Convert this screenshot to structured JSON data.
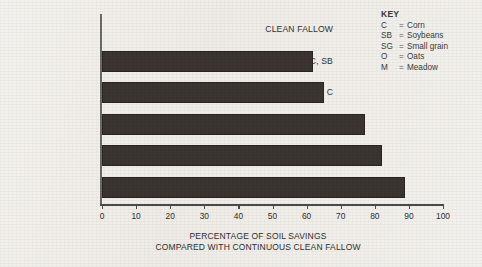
{
  "key": {
    "title": "KEY",
    "equals": "=",
    "entries": [
      {
        "symbol": "C",
        "definition": "Corn"
      },
      {
        "symbol": "SB",
        "definition": "Soybeans"
      },
      {
        "symbol": "SG",
        "definition": "Small grain"
      },
      {
        "symbol": "O",
        "definition": "Oats"
      },
      {
        "symbol": "M",
        "definition": "Meadow"
      }
    ]
  },
  "caption": {
    "line1": "PERCENTAGE OF SOIL SAVINGS",
    "line2": "COMPARED WITH CONTINUOUS CLEAN FALLOW"
  },
  "colors": {
    "bar": "#3b3430",
    "axis": "#4a4a4a",
    "background": "#f2f0ec",
    "text": "#2e2e2e"
  },
  "chart_data": {
    "type": "bar",
    "orientation": "horizontal",
    "title": "",
    "xlabel": "PERCENTAGE OF SOIL SAVINGS COMPARED WITH CONTINUOUS CLEAN FALLOW",
    "ylabel": "",
    "xlim": [
      0,
      100
    ],
    "xticks": [
      0,
      10,
      20,
      30,
      40,
      50,
      60,
      70,
      80,
      90,
      100
    ],
    "xtick_labels": [
      "0",
      "10",
      "20",
      "30",
      "40",
      "50",
      "60",
      "70",
      "80",
      "90",
      "100"
    ],
    "grid": false,
    "legend": "none",
    "categories": [
      "CLEAN FALLOW",
      "C, SB",
      "C, C",
      "C, SG, SB, SG",
      "C, SB, C, O, M, M",
      "C, C, O, M, M, M"
    ],
    "values": [
      0,
      62,
      65,
      77,
      82,
      89
    ]
  }
}
